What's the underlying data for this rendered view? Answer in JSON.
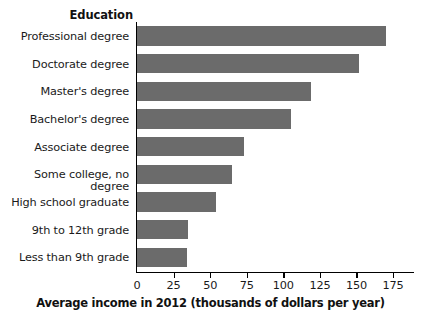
{
  "chart_data": {
    "type": "bar",
    "orientation": "horizontal",
    "title": "",
    "xlabel": "Average income in 2012 (thousands of dollars per year)",
    "ylabel": "Education",
    "categories": [
      "Professional degree",
      "Doctorate degree",
      "Master's degree",
      "Bachelor's degree",
      "Associate degree",
      "Some college, no degree",
      "High school graduate",
      "9th to 12th grade",
      "Less than 9th grade"
    ],
    "values": [
      170,
      152,
      119,
      105,
      73,
      65,
      54,
      35,
      34
    ],
    "xlim": [
      0,
      190
    ],
    "xticks": [
      0,
      25,
      50,
      75,
      100,
      125,
      150,
      175
    ],
    "xticklabels": [
      "0",
      "25",
      "50",
      "75",
      "100",
      "125",
      "150",
      "175"
    ],
    "grid": false,
    "legend": false,
    "bar_color": "#6b6b6b",
    "axis_color": "#000000",
    "background": "#ffffff"
  },
  "axes": {
    "category_axis_title": "Education",
    "value_axis_title": "Average income in 2012 (thousands of dollars per year)"
  }
}
